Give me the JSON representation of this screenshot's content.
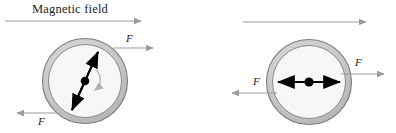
{
  "figure": {
    "title_label": "Magnetic field",
    "background_color": "#ffffff",
    "ring_fill_color": "#c9c9c9",
    "ring_stroke_color": "#6b6b6b",
    "interior_fill_color": "#f7f7f7",
    "arrow_color": "#9a9a9a",
    "dipole_color": "#000000"
  },
  "panels": [
    {
      "name": "left-panel",
      "field_arrow": {
        "label": "Magnetic field",
        "direction": "right",
        "x1": 5,
        "y1": 21,
        "x2": 141,
        "y2": 21
      },
      "circle": {
        "cx": 85,
        "cy": 81,
        "outer_r": 43,
        "inner_r": 37,
        "center_dot_r": 4.2
      },
      "dipole": {
        "type": "double-headed-arrow",
        "tilt_deg": 23,
        "x1": 71,
        "y1": 112,
        "x2": 99,
        "y2": 50
      },
      "rotation_arrow": {
        "present": true,
        "direction": "clockwise"
      },
      "forces": [
        {
          "label": "F",
          "direction": "right",
          "x1": 113,
          "y1": 48,
          "x2": 153,
          "y2": 48,
          "label_x": 126,
          "label_y": 34
        },
        {
          "label": "F",
          "direction": "left",
          "x1": 57,
          "y1": 113,
          "x2": 17,
          "y2": 113,
          "label_x": 38,
          "label_y": 118
        }
      ]
    },
    {
      "name": "right-panel",
      "field_arrow": {
        "label": "",
        "direction": "right",
        "x1": 243,
        "y1": 22,
        "x2": 366,
        "y2": 22
      },
      "circle": {
        "cx": 309,
        "cy": 82,
        "outer_r": 43,
        "inner_r": 37,
        "center_dot_r": 4.5
      },
      "dipole": {
        "type": "double-headed-arrow",
        "tilt_deg": 0,
        "x1": 277,
        "y1": 82,
        "x2": 341,
        "y2": 82
      },
      "rotation_arrow": {
        "present": false,
        "direction": ""
      },
      "forces": [
        {
          "label": "F",
          "direction": "right",
          "x1": 341,
          "y1": 74,
          "x2": 384,
          "y2": 74,
          "label_x": 355,
          "label_y": 59
        },
        {
          "label": "F",
          "direction": "left",
          "x1": 277,
          "y1": 93,
          "x2": 232,
          "y2": 93,
          "label_x": 254,
          "label_y": 78
        }
      ]
    }
  ]
}
